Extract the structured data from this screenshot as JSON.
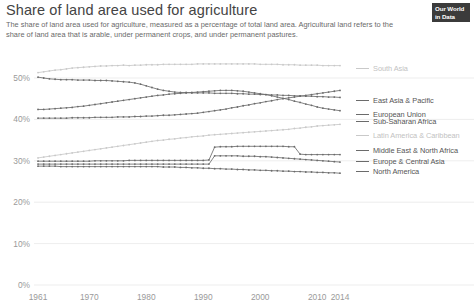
{
  "header": {
    "title": "Share of land area used for agriculture",
    "subtitle": "The share of land area used for agriculture, measured as a percentage of total land area. Agricultural land refers to the share of land area that is arable, under permanent crops, and under permanent pastures.",
    "logo_line1": "Our World",
    "logo_line2": "in Data"
  },
  "chart_data": {
    "type": "line",
    "title": "Share of land area used for agriculture",
    "subtitle": "The share of land area used for agriculture, measured as a percentage of total land area. Agricultural land refers to the share of land area that is arable, under permanent crops, and under permanent pastures.",
    "xlabel": "",
    "ylabel": "",
    "xlim": [
      1961,
      2014
    ],
    "ylim": [
      0,
      55
    ],
    "grid": true,
    "legend_position": "right",
    "x_ticks": [
      "1961",
      "1970",
      "1980",
      "1990",
      "2000",
      "2010",
      "2014"
    ],
    "x_tick_values": [
      1961,
      1970,
      1980,
      1990,
      2000,
      2010,
      2014
    ],
    "y_ticks": [
      "0%",
      "10%",
      "20%",
      "30%",
      "40%",
      "50%"
    ],
    "y_tick_values": [
      0,
      10,
      20,
      30,
      40,
      50
    ],
    "x": [
      1961,
      1962,
      1963,
      1964,
      1965,
      1966,
      1967,
      1968,
      1969,
      1970,
      1971,
      1972,
      1973,
      1974,
      1975,
      1976,
      1977,
      1978,
      1979,
      1980,
      1981,
      1982,
      1983,
      1984,
      1985,
      1986,
      1987,
      1988,
      1989,
      1990,
      1991,
      1992,
      1993,
      1994,
      1995,
      1996,
      1997,
      1998,
      1999,
      2000,
      2001,
      2002,
      2003,
      2004,
      2005,
      2006,
      2007,
      2008,
      2009,
      2010,
      2011,
      2012,
      2013,
      2014
    ],
    "series": [
      {
        "name": "South Asia",
        "color": "#c9c9c9",
        "label_y_pct": 52.2,
        "values": [
          51.3,
          51.5,
          51.7,
          51.9,
          52.0,
          52.2,
          52.4,
          52.5,
          52.6,
          52.7,
          52.8,
          52.9,
          52.9,
          53.0,
          53.0,
          53.1,
          53.0,
          53.1,
          53.1,
          53.2,
          53.2,
          53.2,
          53.3,
          53.3,
          53.3,
          53.3,
          53.3,
          53.3,
          53.4,
          53.4,
          53.4,
          53.4,
          53.4,
          53.4,
          53.4,
          53.4,
          53.4,
          53.4,
          53.4,
          53.3,
          53.3,
          53.3,
          53.3,
          53.2,
          53.2,
          53.2,
          53.1,
          53.1,
          53.1,
          53.1,
          53.0,
          53.0,
          53.0,
          53.0
        ]
      },
      {
        "name": "East Asia & Pacific",
        "color": "#6b6b6b",
        "label_y_pct": 44.6,
        "values": [
          50.2,
          50.0,
          49.8,
          49.7,
          49.6,
          49.6,
          49.6,
          49.5,
          49.5,
          49.5,
          49.4,
          49.4,
          49.4,
          49.3,
          49.2,
          49.1,
          49.0,
          48.8,
          48.5,
          48.1,
          47.7,
          47.3,
          47.0,
          46.8,
          46.6,
          46.5,
          46.5,
          46.4,
          46.4,
          46.4,
          46.4,
          46.3,
          46.3,
          46.3,
          46.3,
          46.2,
          46.2,
          46.1,
          46.1,
          46.0,
          46.0,
          45.9,
          45.9,
          45.8,
          45.8,
          45.7,
          45.7,
          45.6,
          45.6,
          45.5,
          45.5,
          45.4,
          45.4,
          45.3
        ]
      },
      {
        "name": "European Union",
        "color": "#6b6b6b",
        "label_y_pct": 41.3,
        "values": [
          42.4,
          42.4,
          42.5,
          42.6,
          42.7,
          42.8,
          42.9,
          43.1,
          43.2,
          43.4,
          43.6,
          43.8,
          44.0,
          44.2,
          44.4,
          44.6,
          44.8,
          45.0,
          45.2,
          45.4,
          45.6,
          45.8,
          45.9,
          46.1,
          46.2,
          46.3,
          46.4,
          46.5,
          46.6,
          46.7,
          46.8,
          46.9,
          47.0,
          47.0,
          47.0,
          46.9,
          46.8,
          46.6,
          46.4,
          46.2,
          46.0,
          45.7,
          45.4,
          45.1,
          44.8,
          44.4,
          44.1,
          43.7,
          43.4,
          43.0,
          42.7,
          42.5,
          42.3,
          42.1
        ]
      },
      {
        "name": "Sub-Saharan Africa",
        "color": "#6b6b6b",
        "label_y_pct": 39.4,
        "values": [
          40.3,
          40.3,
          40.3,
          40.3,
          40.3,
          40.3,
          40.4,
          40.4,
          40.4,
          40.4,
          40.5,
          40.5,
          40.5,
          40.5,
          40.6,
          40.6,
          40.6,
          40.7,
          40.7,
          40.8,
          40.8,
          40.9,
          41.0,
          41.0,
          41.1,
          41.2,
          41.3,
          41.4,
          41.5,
          41.7,
          41.9,
          42.1,
          42.3,
          42.5,
          42.8,
          43.0,
          43.3,
          43.5,
          43.8,
          44.0,
          44.3,
          44.5,
          44.8,
          45.0,
          45.2,
          45.4,
          45.6,
          45.8,
          46.0,
          46.2,
          46.4,
          46.6,
          46.8,
          47.0
        ]
      },
      {
        "name": "Latin America & Caribbean",
        "color": "#c9c9c9",
        "label_y_pct": 36.1,
        "values": [
          30.7,
          30.9,
          31.1,
          31.3,
          31.5,
          31.7,
          31.9,
          32.1,
          32.3,
          32.5,
          32.7,
          32.9,
          33.1,
          33.3,
          33.5,
          33.7,
          33.9,
          34.1,
          34.3,
          34.5,
          34.7,
          34.9,
          35.0,
          35.2,
          35.3,
          35.5,
          35.6,
          35.8,
          35.9,
          36.0,
          36.2,
          36.3,
          36.4,
          36.5,
          36.6,
          36.7,
          36.8,
          36.9,
          37.0,
          37.1,
          37.2,
          37.3,
          37.4,
          37.5,
          37.6,
          37.8,
          37.9,
          38.1,
          38.2,
          38.4,
          38.5,
          38.6,
          38.7,
          38.8
        ]
      },
      {
        "name": "Middle East & North Africa",
        "color": "#6b6b6b",
        "label_y_pct": 32.4,
        "values": [
          29.9,
          29.9,
          29.9,
          29.9,
          29.9,
          29.9,
          29.9,
          29.9,
          29.9,
          29.9,
          30.0,
          30.0,
          30.0,
          30.0,
          30.0,
          30.0,
          30.1,
          30.1,
          30.1,
          30.1,
          30.1,
          30.1,
          30.1,
          30.1,
          30.1,
          30.1,
          30.1,
          30.1,
          30.1,
          30.1,
          30.2,
          33.3,
          33.4,
          33.4,
          33.4,
          33.5,
          33.5,
          33.5,
          33.5,
          33.5,
          33.5,
          33.5,
          33.5,
          33.5,
          33.4,
          33.4,
          31.6,
          31.5,
          31.5,
          31.5,
          31.5,
          31.5,
          31.5,
          31.5
        ]
      },
      {
        "name": "Europe & Central Asia",
        "color": "#6b6b6b",
        "label_y_pct": 29.9,
        "values": [
          29.2,
          29.2,
          29.2,
          29.2,
          29.2,
          29.2,
          29.2,
          29.2,
          29.2,
          29.2,
          29.2,
          29.2,
          29.2,
          29.2,
          29.2,
          29.2,
          29.2,
          29.2,
          29.2,
          29.2,
          29.2,
          29.2,
          29.2,
          29.2,
          29.2,
          29.2,
          29.2,
          29.2,
          29.2,
          29.2,
          29.2,
          31.2,
          31.2,
          31.2,
          31.2,
          31.2,
          31.1,
          31.1,
          31.1,
          31.0,
          31.0,
          30.9,
          30.8,
          30.7,
          30.6,
          30.5,
          30.4,
          30.3,
          30.2,
          30.1,
          30.0,
          29.9,
          29.8,
          29.7
        ]
      },
      {
        "name": "North America",
        "color": "#6b6b6b",
        "label_y_pct": 27.3,
        "values": [
          28.7,
          28.7,
          28.7,
          28.7,
          28.6,
          28.6,
          28.6,
          28.6,
          28.6,
          28.6,
          28.6,
          28.6,
          28.6,
          28.6,
          28.6,
          28.6,
          28.6,
          28.6,
          28.6,
          28.6,
          28.6,
          28.6,
          28.5,
          28.5,
          28.5,
          28.4,
          28.4,
          28.3,
          28.3,
          28.2,
          28.2,
          28.1,
          28.1,
          28.0,
          28.0,
          27.9,
          27.9,
          27.8,
          27.8,
          27.7,
          27.7,
          27.6,
          27.6,
          27.5,
          27.5,
          27.4,
          27.4,
          27.3,
          27.3,
          27.2,
          27.2,
          27.1,
          27.1,
          27.0
        ]
      }
    ]
  },
  "legend": {
    "items": [
      {
        "label": "South Asia",
        "color": "#c9c9c9"
      },
      {
        "label": "East Asia & Pacific",
        "color": "#6b6b6b"
      },
      {
        "label": "European Union",
        "color": "#6b6b6b"
      },
      {
        "label": "Sub-Saharan Africa",
        "color": "#6b6b6b"
      },
      {
        "label": "Latin America & Caribbean",
        "color": "#c9c9c9"
      },
      {
        "label": "Middle East & North Africa",
        "color": "#6b6b6b"
      },
      {
        "label": "Europe & Central Asia",
        "color": "#6b6b6b"
      },
      {
        "label": "North America",
        "color": "#6b6b6b"
      }
    ]
  }
}
